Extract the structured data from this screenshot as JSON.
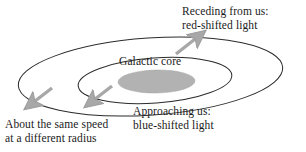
{
  "figure": {
    "kind": "galaxy-rotation-doppler-diagram",
    "background_color": "#ffffff",
    "text_color": "#1a1a1a"
  },
  "labels": {
    "receding": {
      "line1": "Receding from us:",
      "line2": "red-shifted light"
    },
    "core": {
      "line1": "Galactic core"
    },
    "approaching": {
      "line1": "Approaching us:",
      "line2": "blue-shifted light"
    },
    "same_speed": {
      "line1": "About the same speed",
      "line2": "at a different radius"
    }
  },
  "shapes": {
    "outer_ellipse": {
      "name": "outer-orbit-ellipse",
      "cx": 150.5,
      "cy": 76.5,
      "rx": 132.5,
      "ry": 38.5,
      "rotation_deg": -4,
      "stroke": "#2b2b2b",
      "stroke_width": 1,
      "fill": "none"
    },
    "inner_ellipse": {
      "name": "inner-orbit-ellipse",
      "cx": 155,
      "cy": 80.5,
      "rx": 77,
      "ry": 22.5,
      "rotation_deg": -4,
      "stroke": "#2b2b2b",
      "stroke_width": 1,
      "fill": "none"
    },
    "core_ellipse": {
      "name": "galactic-core-ellipse",
      "cx": 156.5,
      "cy": 81.5,
      "rx": 38.5,
      "ry": 11.5,
      "rotation_deg": -1,
      "fill": "#b2b2b2",
      "stroke": "#a0a0a0",
      "stroke_width": 0.5
    }
  },
  "arrows": {
    "color": "#a8a8a8",
    "stroke": "#9a9a9a",
    "items": [
      {
        "name": "arrow-receding-outer",
        "direction": "up-right",
        "x1": 176,
        "y1": 54,
        "x2": 207,
        "y2": 30
      },
      {
        "name": "arrow-approaching-inner",
        "direction": "down-left",
        "x1": 112,
        "y1": 86,
        "x2": 84,
        "y2": 108
      },
      {
        "name": "arrow-same-speed-outer",
        "direction": "down-left",
        "x1": 52,
        "y1": 87,
        "x2": 24,
        "y2": 110
      }
    ]
  }
}
